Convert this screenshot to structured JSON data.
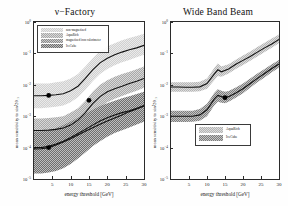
{
  "figure": {
    "background": "#ffffff",
    "axis_color": "#2b2b2b"
  },
  "panels": {
    "left": {
      "title": "ν−Factory",
      "xlabel": "energy threshold [GeV]",
      "ylabel": "mean sensitivity to sin²2θ₁₃",
      "legend": [
        {
          "label": "non-magnetized",
          "color": "#d0d0d0"
        },
        {
          "label": "AquaRich",
          "color": "#a8a8a8"
        },
        {
          "label": "magnetized iron calorimeter",
          "color": "#8c8c8c"
        },
        {
          "label": "IceCube",
          "color": "#6e6e6e"
        }
      ]
    },
    "right": {
      "title": "Wide Band Beam",
      "xlabel": "energy threshold [GeV]",
      "ylabel": "mean sensitivity to sin²2θ₁₃",
      "legend": [
        {
          "label": "AquaRich",
          "color": "#b4b4b4"
        },
        {
          "label": "IceCube",
          "color": "#7d7d7d"
        }
      ]
    }
  },
  "ticks": {
    "y_labels": [
      "10",
      "10",
      "10",
      "10",
      "10",
      "10"
    ],
    "y_exponents": [
      "0",
      "−1",
      "−2",
      "−3",
      "−4",
      "−5"
    ],
    "x_labels": [
      "5",
      "10",
      "15",
      "20",
      "25",
      "30"
    ]
  },
  "chart_data": {
    "type": "line",
    "xlabel": "energy threshold [GeV]",
    "ylabel": "mean sensitivity to sin²2θ₁₃",
    "xlim": [
      0,
      30
    ],
    "ylim": [
      1e-05,
      1
    ],
    "yscale": "log",
    "xticks": [
      5,
      10,
      15,
      20,
      25,
      30
    ],
    "yticks": [
      1,
      0.1,
      0.01,
      0.001,
      0.0001,
      1e-05
    ],
    "grid": false,
    "panels": [
      {
        "name": "ν−Factory",
        "legend_position": "upper-left",
        "series": [
          {
            "name": "non-magnetized",
            "color": "#d0d0d0",
            "x": [
              0,
              2,
              4,
              6,
              8,
              10,
              12,
              14,
              16,
              18,
              20,
              22,
              24,
              26,
              28,
              30
            ],
            "center": [
              0.0045,
              0.0045,
              0.0046,
              0.0048,
              0.0052,
              0.0065,
              0.009,
              0.016,
              0.03,
              0.05,
              0.07,
              0.09,
              0.11,
              0.13,
              0.15,
              0.18
            ],
            "lower": [
              0.0018,
              0.0018,
              0.0019,
              0.002,
              0.0022,
              0.0028,
              0.004,
              0.007,
              0.013,
              0.022,
              0.032,
              0.042,
              0.052,
              0.062,
              0.075,
              0.09
            ],
            "upper": [
              0.011,
              0.011,
              0.011,
              0.012,
              0.013,
              0.016,
              0.022,
              0.038,
              0.07,
              0.12,
              0.17,
              0.21,
              0.26,
              0.31,
              0.36,
              0.42
            ],
            "marker": {
              "x": 4,
              "y": 0.0046
            }
          },
          {
            "name": "AquaRich",
            "color": "#a8a8a8",
            "x": [
              0,
              2,
              4,
              6,
              8,
              10,
              12,
              14,
              16,
              18,
              20,
              22,
              24,
              26,
              28,
              30
            ],
            "center": [
              0.00035,
              0.00035,
              0.00036,
              0.00038,
              0.00042,
              0.00052,
              0.00075,
              0.0013,
              0.0025,
              0.0042,
              0.006,
              0.0075,
              0.009,
              0.011,
              0.013,
              0.016
            ],
            "lower": [
              0.00014,
              0.00014,
              0.00015,
              0.00016,
              0.00018,
              0.00022,
              0.00032,
              0.00055,
              0.0011,
              0.0019,
              0.0028,
              0.0036,
              0.0044,
              0.0054,
              0.0065,
              0.008
            ],
            "upper": [
              0.00085,
              0.00085,
              0.00088,
              0.00092,
              0.001,
              0.0013,
              0.0018,
              0.0031,
              0.006,
              0.01,
              0.014,
              0.018,
              0.022,
              0.026,
              0.031,
              0.038
            ],
            "marker": {
              "x": 15,
              "y": 0.0032
            }
          },
          {
            "name": "magnetized iron calorimeter",
            "color": "#8c8c8c",
            "x": [
              0,
              2,
              4,
              6,
              8,
              10,
              12,
              14,
              16,
              18,
              20,
              22,
              24,
              26,
              28,
              30
            ],
            "center": [
              9e-05,
              9.2e-05,
              0.0001,
              0.00012,
              0.00015,
              0.00019,
              0.00025,
              0.00033,
              0.00043,
              0.00055,
              0.0007,
              0.00088,
              0.0011,
              0.0014,
              0.0017,
              0.0021
            ],
            "lower": [
              5e-05,
              5.2e-05,
              5.6e-05,
              6.5e-05,
              8e-05,
              0.0001,
              0.00013,
              0.00018,
              0.00023,
              0.0003,
              0.00038,
              0.00048,
              0.0006,
              0.00075,
              0.00092,
              0.0011
            ],
            "upper": [
              0.00016,
              0.00017,
              0.00019,
              0.00022,
              0.00028,
              0.00035,
              0.00046,
              0.00061,
              0.0008,
              0.001,
              0.0013,
              0.0016,
              0.002,
              0.0025,
              0.0031,
              0.0039
            ],
            "marker": {
              "x": 4,
              "y": 0.0001
            }
          },
          {
            "name": "IceCube",
            "color": "#6e6e6e",
            "x": [
              0,
              2,
              4,
              6,
              8,
              10,
              12,
              14,
              16,
              18,
              20,
              22,
              24,
              26,
              28,
              30
            ],
            "center": [
              0.0001,
              0.0001,
              0.00011,
              0.00013,
              0.00016,
              0.00021,
              0.00028,
              0.00038,
              0.00052,
              0.0007,
              0.0009,
              0.0011,
              0.0013,
              0.0015,
              0.0018,
              0.0022
            ],
            "lower": [
              1.5e-05,
              1.5e-05,
              1.6e-05,
              1.8e-05,
              2.2e-05,
              3e-05,
              4.5e-05,
              7e-05,
              0.00011,
              0.00016,
              0.00022,
              0.00029,
              0.00036,
              0.00044,
              0.00054,
              0.00066
            ],
            "upper": [
              0.00032,
              0.00033,
              0.00036,
              0.00042,
              0.00052,
              0.00068,
              0.0009,
              0.0012,
              0.0016,
              0.0021,
              0.0026,
              0.0031,
              0.0037,
              0.0043,
              0.0051,
              0.006
            ]
          }
        ]
      },
      {
        "name": "Wide Band Beam",
        "legend_position": "lower-center",
        "series": [
          {
            "name": "AquaRich",
            "color": "#b4b4b4",
            "x": [
              0,
              2,
              4,
              6,
              8,
              10,
              12,
              13,
              14,
              16,
              18,
              20,
              22,
              24,
              26,
              28,
              30
            ],
            "center": [
              0.0085,
              0.0085,
              0.0084,
              0.0084,
              0.0086,
              0.011,
              0.022,
              0.03,
              0.026,
              0.032,
              0.045,
              0.06,
              0.08,
              0.11,
              0.15,
              0.2,
              0.28
            ],
            "lower": [
              0.006,
              0.006,
              0.006,
              0.006,
              0.0062,
              0.0075,
              0.014,
              0.019,
              0.018,
              0.023,
              0.032,
              0.043,
              0.058,
              0.08,
              0.11,
              0.15,
              0.21
            ],
            "upper": [
              0.012,
              0.012,
              0.012,
              0.012,
              0.0125,
              0.016,
              0.034,
              0.048,
              0.038,
              0.045,
              0.063,
              0.085,
              0.115,
              0.16,
              0.22,
              0.3,
              0.4
            ]
          },
          {
            "name": "IceCube",
            "color": "#7d7d7d",
            "x": [
              0,
              2,
              4,
              6,
              8,
              10,
              12,
              13,
              14,
              15,
              16,
              18,
              20,
              22,
              24,
              26,
              28,
              30
            ],
            "center": [
              0.001,
              0.001,
              0.001,
              0.001,
              0.0011,
              0.0016,
              0.0035,
              0.0046,
              0.0042,
              0.0039,
              0.0042,
              0.0055,
              0.0075,
              0.011,
              0.016,
              0.023,
              0.033,
              0.046
            ],
            "lower": [
              0.00065,
              0.00065,
              0.00065,
              0.00066,
              0.00072,
              0.001,
              0.0022,
              0.0029,
              0.0027,
              0.0026,
              0.0029,
              0.0039,
              0.0054,
              0.008,
              0.012,
              0.017,
              0.025,
              0.035
            ],
            "upper": [
              0.0015,
              0.0015,
              0.0015,
              0.0015,
              0.0017,
              0.0025,
              0.0055,
              0.0072,
              0.0065,
              0.006,
              0.0064,
              0.0082,
              0.011,
              0.016,
              0.023,
              0.032,
              0.045,
              0.062
            ],
            "marker": {
              "x": 15,
              "y": 0.0039
            }
          }
        ]
      }
    ]
  }
}
